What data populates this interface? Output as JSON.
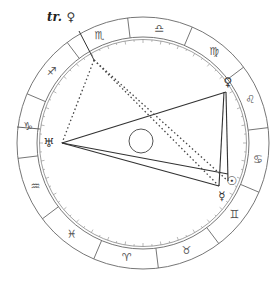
{
  "chart": {
    "center": [
      143,
      143
    ],
    "outer_radius": 126,
    "ring_radius": 106,
    "inner_ring_radius": 103,
    "core_radius": 12,
    "colors": {
      "ring": "#666666",
      "aspect": "#333333",
      "transit": "#444444"
    }
  },
  "signs": [
    {
      "name": "Aries",
      "glyph": "♈"
    },
    {
      "name": "Taurus",
      "glyph": "♉"
    },
    {
      "name": "Gemini",
      "glyph": "♊"
    },
    {
      "name": "Cancer",
      "glyph": "♋"
    },
    {
      "name": "Leo",
      "glyph": "♌"
    },
    {
      "name": "Virgo",
      "glyph": "♍"
    },
    {
      "name": "Libra",
      "glyph": "♎"
    },
    {
      "name": "Scorpio",
      "glyph": "♏"
    },
    {
      "name": "Sagittarius",
      "glyph": "♐"
    },
    {
      "name": "Capricorn",
      "glyph": "♑"
    },
    {
      "name": "Aquarius",
      "glyph": "♒"
    },
    {
      "name": "Pisces",
      "glyph": "♓"
    }
  ],
  "planets": {
    "uranus": {
      "glyph": "♅",
      "label_xy": [
        49,
        143
      ],
      "point_xy": [
        62,
        143
      ]
    },
    "venus": {
      "glyph": "♀",
      "label_xy": [
        228,
        82
      ],
      "point_xy": [
        226,
        92
      ]
    },
    "sun": {
      "glyph": "☉",
      "label_xy": [
        231,
        181
      ],
      "point_xy": [
        228,
        181
      ]
    },
    "mercury": {
      "glyph": "☿",
      "label_xy": [
        222,
        194
      ],
      "point_xy": [
        219,
        186
      ]
    }
  },
  "transit": {
    "label": "tr.",
    "glyph": "♀",
    "label_xy": [
      70,
      17
    ]
  }
}
